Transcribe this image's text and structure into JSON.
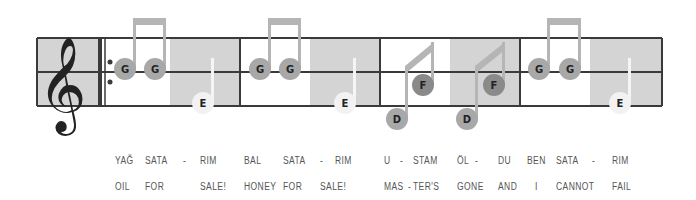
{
  "colors": {
    "staff_line": "#3a3a3a",
    "shade": "#d4d4d4",
    "note_gray": "#a8a8a8",
    "note_dark": "#8a8a8a",
    "note_white": "#f2f2f2",
    "stem_gray": "#b5b5b5",
    "clef": "#222222"
  },
  "clef": {
    "icon": "treble-clef-icon",
    "glyph": "𝄞"
  },
  "measures": [
    {
      "notes": [
        {
          "name": "G",
          "style": "gray"
        },
        {
          "name": "G",
          "style": "gray"
        },
        {
          "name": "E",
          "style": "white"
        }
      ]
    },
    {
      "notes": [
        {
          "name": "G",
          "style": "gray"
        },
        {
          "name": "G",
          "style": "gray"
        },
        {
          "name": "E",
          "style": "white"
        }
      ]
    },
    {
      "notes": [
        {
          "name": "D",
          "style": "gray"
        },
        {
          "name": "F",
          "style": "dark"
        },
        {
          "name": "D",
          "style": "gray"
        },
        {
          "name": "F",
          "style": "dark"
        }
      ]
    },
    {
      "notes": [
        {
          "name": "G",
          "style": "gray"
        },
        {
          "name": "G",
          "style": "gray"
        },
        {
          "name": "E",
          "style": "white"
        }
      ]
    }
  ],
  "lyrics": {
    "line1": [
      "YAĞ",
      "SATA",
      "-",
      "RIM",
      "BAL",
      "SATA",
      "-",
      "RIM",
      "U",
      "-",
      "STAM",
      "ÖL",
      "-",
      "DU",
      "BEN",
      "SATA",
      "-",
      "RIM"
    ],
    "line2": [
      "OIL",
      "FOR",
      "SALE!",
      "HONEY",
      "FOR",
      "SALE!",
      "MAS",
      "-",
      "TER'S",
      "GONE",
      "AND",
      "I",
      "CANNOT",
      "FAIL"
    ]
  }
}
